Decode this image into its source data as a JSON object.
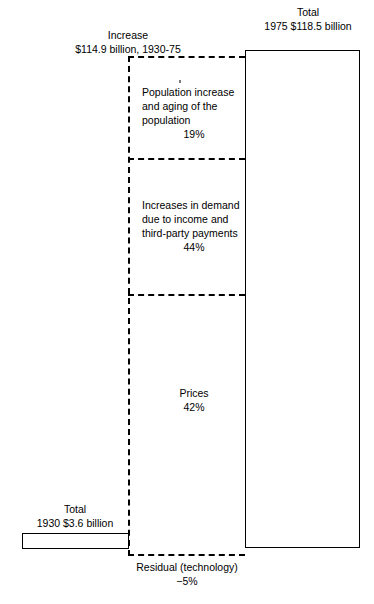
{
  "figure": {
    "background": "#ffffff",
    "line_color": "#000000"
  },
  "totals": {
    "y1975": {
      "caption_line1": "Total",
      "caption_line2": "1975  $118.5 billion",
      "year": "1975",
      "amount": "$118.5 billion"
    },
    "y1930": {
      "caption_line1": "Total",
      "caption_line2": "1930   $3.6 billion",
      "year": "1930",
      "amount": "$3.6 billion"
    }
  },
  "increase": {
    "caption_line1": "Increase",
    "caption_line2": "$114.9 billion, 1930-75",
    "amount": "$114.9 billion",
    "period": "1930-75"
  },
  "segments": {
    "population": {
      "label": "Population increase and aging of the population",
      "line1": "Population increase",
      "line2": "and aging of the",
      "line3": "population",
      "percent": "19%"
    },
    "demand": {
      "label": "Increases in demand due to income and third-party payments",
      "line1": "Increases in demand",
      "line2": "due to income and",
      "line3": "third-party payments",
      "percent": "44%"
    },
    "prices": {
      "label": "Prices",
      "percent": "42%"
    },
    "residual": {
      "label": "Residual (technology)",
      "percent": "−5%"
    }
  },
  "chart_data": {
    "type": "bar",
    "title": "",
    "subtitle": "",
    "xlabel": "",
    "ylabel": "",
    "legend_position": "none",
    "grid": false,
    "units": "billion US dollars",
    "totals": [
      {
        "name": "Total 1930",
        "year": "1930",
        "value": 3.6,
        "label": "$3.6 billion"
      },
      {
        "name": "Total 1975",
        "year": "1975",
        "value": 118.5,
        "label": "$118.5 billion"
      }
    ],
    "increase": {
      "name": "Increase 1930-75",
      "value": 114.9,
      "label": "$114.9 billion, 1930-75"
    },
    "categories": [
      "Population increase and aging of the population",
      "Increases in demand due to income and third-party payments",
      "Prices",
      "Residual (technology)"
    ],
    "values": [
      19,
      44,
      42,
      -5
    ],
    "value_labels": [
      "19%",
      "44%",
      "42%",
      "−5%"
    ],
    "series": [
      {
        "name": "Share of increase",
        "values": [
          19,
          44,
          42,
          -5
        ]
      }
    ]
  }
}
